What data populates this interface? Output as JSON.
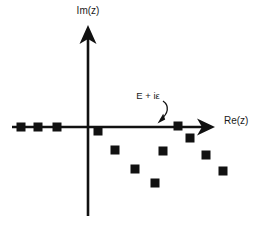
{
  "figure": {
    "name": "complex-plane-pole-diagram",
    "width": 273,
    "height": 226,
    "background_color": "#ffffff",
    "ink_color": "#111111"
  },
  "axes": {
    "real": {
      "label": "Re(z)",
      "label_x": 232,
      "label_y": 124,
      "y": 127,
      "x_start": 12,
      "x_end": 213,
      "arrow": "right"
    },
    "imaginary": {
      "label": "Im(z)",
      "label_x": 88,
      "label_y": 14,
      "x": 88,
      "y_start": 26,
      "y_end": 216,
      "arrow": "up"
    },
    "origin": {
      "x": 88,
      "y": 127
    }
  },
  "annotation": {
    "label": "E + iε",
    "label_x": 148,
    "label_y": 99,
    "arrow_tip": {
      "x": 160,
      "y": 122
    },
    "arrow_start": {
      "x": 167,
      "y": 98
    }
  },
  "chart_data": {
    "type": "scatter",
    "title": "",
    "xlabel": "Re(z)",
    "ylabel": "Im(z)",
    "marker": "filled-square",
    "marker_color": "#111111",
    "grid": false,
    "legend": null,
    "series": [
      {
        "name": "bound-state-poles",
        "description": "poles on the negative real axis",
        "points": [
          {
            "px": 21,
            "py": 127
          },
          {
            "px": 38,
            "py": 127
          },
          {
            "px": 57,
            "py": 127
          }
        ]
      },
      {
        "name": "resonance-poles",
        "description": "poles in the lower half plane and on the positive real axis",
        "points": [
          {
            "px": 98,
            "py": 131
          },
          {
            "px": 115,
            "py": 150
          },
          {
            "px": 135,
            "py": 169
          },
          {
            "px": 155,
            "py": 183
          },
          {
            "px": 163,
            "py": 151
          },
          {
            "px": 178,
            "py": 126
          },
          {
            "px": 190,
            "py": 138
          },
          {
            "px": 206,
            "py": 155
          },
          {
            "px": 223,
            "py": 171
          }
        ]
      }
    ]
  }
}
